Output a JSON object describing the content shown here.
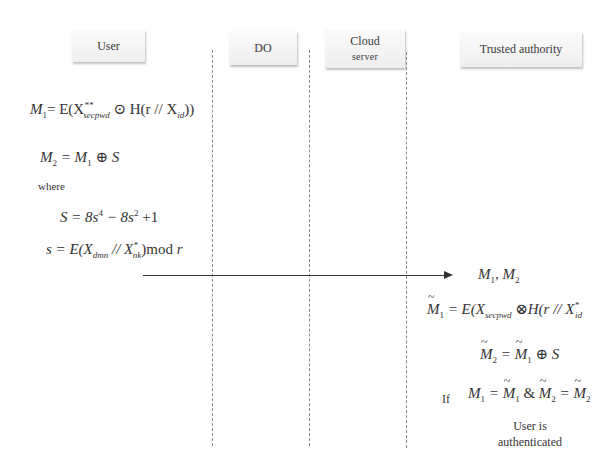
{
  "actors": [
    {
      "id": "user",
      "label": "User"
    },
    {
      "id": "do",
      "label": "DO"
    },
    {
      "id": "cloud",
      "label": "Cloud",
      "sublabel": "server"
    },
    {
      "id": "ta",
      "label": "Trusted authority"
    }
  ],
  "user_side": {
    "eq1": {
      "lhs": "M",
      "lhs_sub": "1",
      "rhs": "= E(X",
      "sup": "**",
      "sub": "secpwd",
      "rest": " ⊙ H(r // X",
      "sub2": "id",
      "close": "))"
    },
    "eq2": {
      "text_a": "M",
      "sub_a": "2",
      "text_b": " = M",
      "sub_b": "1",
      "text_c": " ⊕ S"
    },
    "where_label": "where",
    "eq3": {
      "a": "S = 8s",
      "sup1": "4",
      "b": " − 8s",
      "sup2": "2",
      "c": " +1"
    },
    "eq4": {
      "a": "s = E(X",
      "sub1": "dmn",
      "b": " // X",
      "sup2": "*",
      "sub2": "nk",
      "c": ")mod ",
      "d": "r"
    }
  },
  "message": {
    "label_a": "M",
    "sub_a": "1",
    "sep": ", M",
    "sub_b": "2"
  },
  "ta_side": {
    "eq5": {
      "a": "M",
      "sub_a": "1",
      "b": " = E(X",
      "sub_b": "secpwd",
      "c": " ⊗H(r // X",
      "sup_c": "*",
      "sub_c": "id"
    },
    "eq6": {
      "a": "M",
      "sub_a": "2",
      "b": " = ",
      "c": "M",
      "sub_c": "1",
      "d": " ⊕ S"
    },
    "if_label": "If",
    "eq7": {
      "a": "M",
      "sub_a": "1",
      "b": " = ",
      "c": "M",
      "sub_c": "1",
      "d": " & ",
      "e": "M",
      "sub_e": "2",
      "f": " = ",
      "g": "M",
      "sub_g": "2"
    },
    "result_line1": "User is",
    "result_line2": "authenticated"
  }
}
